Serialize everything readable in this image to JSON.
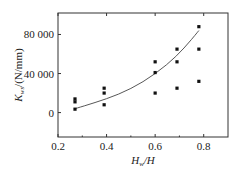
{
  "chart_data": {
    "type": "scatter",
    "title": "",
    "xlabel": "H_w/H",
    "ylabel": "K_ws/(N/mm)",
    "xlim": [
      0.2,
      0.9
    ],
    "ylim": [
      -25000,
      102000
    ],
    "xticks": [
      0.2,
      0.4,
      0.6,
      0.8
    ],
    "xtick_labels": [
      "0.2",
      "0.4",
      "0.6",
      "0.8"
    ],
    "yticks": [
      0,
      40000,
      80000
    ],
    "ytick_labels": [
      "0",
      "40 000",
      "80 000"
    ],
    "grid": false,
    "legend": null,
    "series": [
      {
        "name": "measured",
        "kind": "scatter",
        "marker": "square",
        "points": [
          {
            "x": 0.27,
            "y": 14000
          },
          {
            "x": 0.27,
            "y": 11000
          },
          {
            "x": 0.27,
            "y": 3500
          },
          {
            "x": 0.39,
            "y": 25000
          },
          {
            "x": 0.39,
            "y": 20000
          },
          {
            "x": 0.39,
            "y": 8000
          },
          {
            "x": 0.6,
            "y": 52000
          },
          {
            "x": 0.6,
            "y": 41000
          },
          {
            "x": 0.6,
            "y": 20000
          },
          {
            "x": 0.69,
            "y": 65000
          },
          {
            "x": 0.69,
            "y": 52000
          },
          {
            "x": 0.69,
            "y": 25000
          },
          {
            "x": 0.78,
            "y": 88000
          },
          {
            "x": 0.78,
            "y": 65000
          },
          {
            "x": 0.78,
            "y": 32000
          }
        ]
      },
      {
        "name": "fit",
        "kind": "line",
        "points": [
          {
            "x": 0.27,
            "y": 4000
          },
          {
            "x": 0.35,
            "y": 10000
          },
          {
            "x": 0.45,
            "y": 18500
          },
          {
            "x": 0.55,
            "y": 31000
          },
          {
            "x": 0.65,
            "y": 49000
          },
          {
            "x": 0.72,
            "y": 66000
          },
          {
            "x": 0.78,
            "y": 84000
          }
        ]
      }
    ]
  },
  "axes": {
    "x_label_main": "H",
    "x_label_sub": "w",
    "x_label_rest": "/H",
    "y_label_main": "K",
    "y_label_sub": "ws",
    "y_label_rest": "/(N/mm)"
  }
}
